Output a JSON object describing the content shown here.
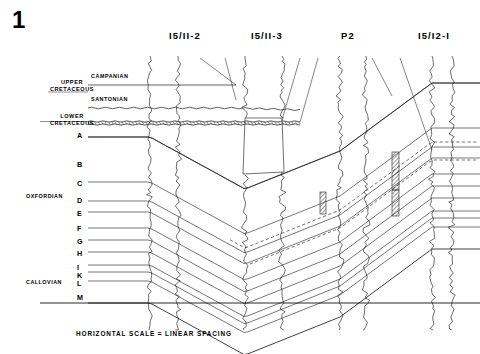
{
  "figure": {
    "number": "1",
    "caption": "HORIZONTAL SCALE = LINEAR SPACING"
  },
  "wells": [
    {
      "name": "I5/II-2",
      "label_x": 185,
      "track_x": 150,
      "pair_x": 178
    },
    {
      "name": "I5/II-3",
      "label_x": 267,
      "track_x": 245,
      "pair_x": 282
    },
    {
      "name": "P2",
      "label_x": 348,
      "track_x": 340,
      "pair_x": 366
    },
    {
      "name": "I5/I2-I",
      "label_x": 434,
      "track_x": 432,
      "pair_x": 452
    }
  ],
  "stratigraphy": [
    {
      "name": "UPPER\nCRETACEOUS",
      "x": 72,
      "y": 79
    },
    {
      "name": "LOWER\nCRETACEOUS",
      "x": 72,
      "y": 113
    }
  ],
  "stages": [
    {
      "name": "CAMPANIAN",
      "x": 91,
      "y": 73
    },
    {
      "name": "SANTONIAN",
      "x": 91,
      "y": 96
    }
  ],
  "epochs": [
    {
      "name": "OXFORDIAN",
      "x": 26,
      "y": 193
    },
    {
      "name": "CALLOVIAN",
      "x": 26,
      "y": 279
    }
  ],
  "markers": [
    {
      "id": "A",
      "y": 137,
      "label_y": 131
    },
    {
      "id": "B",
      "y": 137,
      "label_y": 160
    },
    {
      "id": "C",
      "y": 182,
      "label_y": 179
    },
    {
      "id": "D",
      "y": 201,
      "label_y": 196
    },
    {
      "id": "E",
      "y": 212,
      "label_y": 209
    },
    {
      "id": "F",
      "y": 228,
      "label_y": 224
    },
    {
      "id": "G",
      "y": 240,
      "label_y": 237
    },
    {
      "id": "H",
      "y": 252,
      "label_y": 249
    },
    {
      "id": "I",
      "y": 265,
      "label_y": 263
    },
    {
      "id": "K",
      "y": 272,
      "label_y": 271
    },
    {
      "id": "L",
      "y": 281,
      "label_y": 279
    },
    {
      "id": "M",
      "y": 303,
      "label_y": 293
    }
  ],
  "colors": {
    "ink": "#000000",
    "line": "#2b2b2b",
    "paper": "#ffffff",
    "hatch": "#555555"
  },
  "annotations": {
    "unconformity_style": "wavy",
    "dashed_correlation": "dashed",
    "shaded_intervals": "hatched"
  }
}
